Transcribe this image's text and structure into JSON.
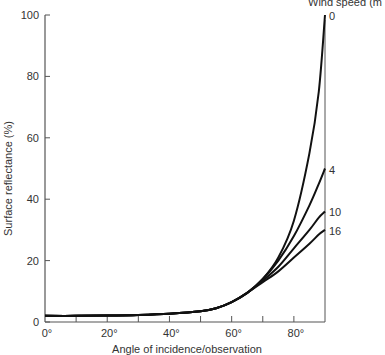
{
  "chart_data": {
    "type": "line",
    "title": "",
    "xlabel": "Angle of incidence/observation",
    "ylabel": "Surface reflectance (%)",
    "legend_title": "Wind speed (m",
    "xlim": [
      0,
      90
    ],
    "ylim": [
      0,
      100
    ],
    "x_ticks": [
      "0°",
      "20°",
      "40°",
      "60°",
      "80°"
    ],
    "y_ticks": [
      "0",
      "20",
      "40",
      "60",
      "80",
      "100"
    ],
    "x": [
      0,
      10,
      20,
      30,
      40,
      50,
      55,
      60,
      65,
      70,
      75,
      80,
      85,
      88,
      90
    ],
    "series": [
      {
        "name": "0",
        "values": [
          2,
          2,
          2.1,
          2.3,
          2.7,
          3.5,
          4.5,
          6.5,
          9.5,
          14,
          21,
          33,
          55,
          75,
          100
        ]
      },
      {
        "name": "4",
        "values": [
          2,
          2,
          2.1,
          2.3,
          2.7,
          3.5,
          4.5,
          6.5,
          9.5,
          14,
          20,
          28,
          38,
          45,
          50
        ]
      },
      {
        "name": "10",
        "values": [
          2,
          2,
          2.1,
          2.3,
          2.7,
          3.5,
          4.5,
          6.5,
          9.5,
          13.5,
          18,
          24,
          30,
          34,
          36
        ]
      },
      {
        "name": "16",
        "values": [
          2,
          2,
          2.1,
          2.3,
          2.7,
          3.5,
          4.5,
          6.5,
          9.5,
          13,
          16.5,
          21,
          25.5,
          28.5,
          30
        ]
      }
    ],
    "grid": false,
    "legend_position": "right end labels"
  }
}
